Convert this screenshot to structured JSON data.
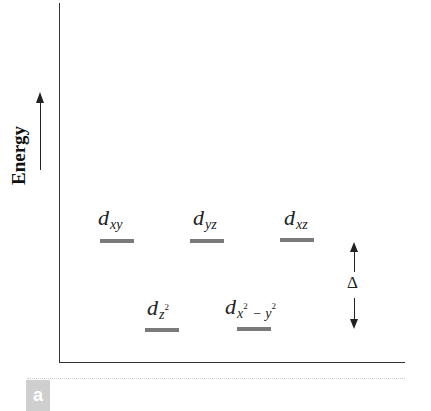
{
  "diagram": {
    "type": "energy-level-diagram",
    "y_axis_label": "Energy",
    "y_axis_arrow": "up",
    "panel_label": "a",
    "splitting_symbol": "Δ",
    "colors": {
      "level_bar": "#7a7a7a",
      "axis": "#333333",
      "text": "#222222",
      "badge_bg": "#cfcfcf",
      "badge_text": "#ffffff"
    },
    "upper_levels": [
      {
        "base": "d",
        "sub": "xy",
        "sup": ""
      },
      {
        "base": "d",
        "sub": "yz",
        "sup": ""
      },
      {
        "base": "d",
        "sub": "xz",
        "sup": ""
      }
    ],
    "lower_levels": [
      {
        "base": "d",
        "sub": "z",
        "sup": "2",
        "sub2": "",
        "sup2": ""
      },
      {
        "base": "d",
        "sub": "x",
        "sup": "2",
        "sub2": " − y",
        "sup2": "2"
      }
    ]
  }
}
